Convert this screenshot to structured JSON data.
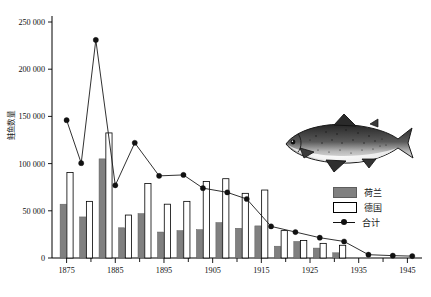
{
  "chart_data": {
    "type": "bar",
    "title": "",
    "subtitle": "",
    "xlabel": "",
    "ylabel": "鲑鱼数量",
    "xlim": [
      1872,
      1948
    ],
    "ylim": [
      0,
      250000
    ],
    "grid": false,
    "legend_position": "right",
    "y_ticks": [
      "0",
      "50 000",
      "100 000",
      "150 000",
      "200 000",
      "250 000"
    ],
    "y_tick_values": [
      0,
      50000,
      100000,
      150000,
      200000,
      250000
    ],
    "x_ticks": [
      "1875",
      "1885",
      "1895",
      "1905",
      "1915",
      "1925",
      "1935",
      "1945"
    ],
    "x_tick_values": [
      1875,
      1885,
      1895,
      1905,
      1915,
      1925,
      1935,
      1945
    ],
    "x_minor_tick_values": [
      1880,
      1890,
      1900,
      1910,
      1920,
      1930,
      1940
    ],
    "x": [
      1875,
      1878,
      1881,
      1884,
      1887,
      1890,
      1893,
      1896,
      1899,
      1902,
      1905,
      1908,
      1911,
      1914,
      1917,
      1920,
      1923,
      1926,
      1929,
      1932,
      1935,
      1938,
      1941,
      1944
    ],
    "series": [
      {
        "name": "荷兰",
        "type": "bar",
        "color": "#808080",
        "values": [
          57000,
          43500,
          105000,
          0,
          32000,
          47000,
          27500,
          29000,
          0,
          30000,
          37500,
          31500,
          25500,
          34000,
          0,
          12500,
          17500,
          10500,
          5500,
          1500,
          0,
          0,
          0,
          0
        ]
      },
      {
        "name": "德国",
        "type": "bar",
        "color": "#ffffff",
        "values": [
          90500,
          60000,
          132500,
          0,
          45500,
          79000,
          0,
          57500,
          0,
          60000,
          81000,
          58500,
          68500,
          72000,
          0,
          29000,
          18500,
          15500,
          10000,
          13500,
          0,
          0,
          0,
          0
        ]
      },
      {
        "name": "合计",
        "type": "line",
        "color": "#1a1a1a",
        "values": [
          146000,
          100500,
          231000,
          0,
          77000,
          122000,
          0,
          87000,
          0,
          88000,
          74000,
          69500,
          62500,
          62000,
          0,
          33500,
          27500,
          24000,
          16500,
          17500,
          4000,
          1500,
          1200,
          1000
        ]
      }
    ],
    "line_points": [
      {
        "x": 1875,
        "y": 146000
      },
      {
        "x": 1878,
        "y": 100500
      },
      {
        "x": 1881,
        "y": 231000
      },
      {
        "x": 1885,
        "y": 77000
      },
      {
        "x": 1889,
        "y": 122000
      },
      {
        "x": 1894,
        "y": 87000
      },
      {
        "x": 1899,
        "y": 88000
      },
      {
        "x": 1903,
        "y": 74000
      },
      {
        "x": 1908,
        "y": 69500
      },
      {
        "x": 1912,
        "y": 62500
      },
      {
        "x": 1917,
        "y": 33500
      },
      {
        "x": 1922,
        "y": 27500
      },
      {
        "x": 1927,
        "y": 21500
      },
      {
        "x": 1932,
        "y": 17500
      },
      {
        "x": 1937,
        "y": 3500
      },
      {
        "x": 1942,
        "y": 2500
      },
      {
        "x": 1946,
        "y": 2000
      }
    ],
    "bar_pairs": [
      {
        "x": 1875,
        "nl": 57000,
        "de": 90500
      },
      {
        "x": 1879,
        "nl": 43500,
        "de": 60000
      },
      {
        "x": 1883,
        "nl": 105000,
        "de": 132500
      },
      {
        "x": 1887,
        "nl": 32000,
        "de": 45500
      },
      {
        "x": 1891,
        "nl": 47000,
        "de": 79000
      },
      {
        "x": 1895,
        "nl": 27500,
        "de": 57000
      },
      {
        "x": 1899,
        "nl": 29000,
        "de": 60000
      },
      {
        "x": 1903,
        "nl": 30000,
        "de": 81000
      },
      {
        "x": 1907,
        "nl": 37500,
        "de": 84000
      },
      {
        "x": 1911,
        "nl": 31500,
        "de": 68500
      },
      {
        "x": 1915,
        "nl": 34000,
        "de": 72000
      },
      {
        "x": 1919,
        "nl": 12500,
        "de": 29000
      },
      {
        "x": 1923,
        "nl": 17500,
        "de": 18500
      },
      {
        "x": 1927,
        "nl": 10500,
        "de": 15500
      },
      {
        "x": 1931,
        "nl": 5500,
        "de": 13500
      }
    ],
    "annotations": [
      {
        "name": "salmon-illustration",
        "kind": "image",
        "description": "salmon fish drawing"
      }
    ]
  },
  "legend": {
    "items": [
      {
        "label": "荷兰",
        "marker": "filled-square",
        "color": "#808080"
      },
      {
        "label": "德国",
        "marker": "open-square",
        "color": "#ffffff"
      },
      {
        "label": "合计",
        "marker": "line-dot",
        "color": "#1a1a1a"
      }
    ]
  }
}
